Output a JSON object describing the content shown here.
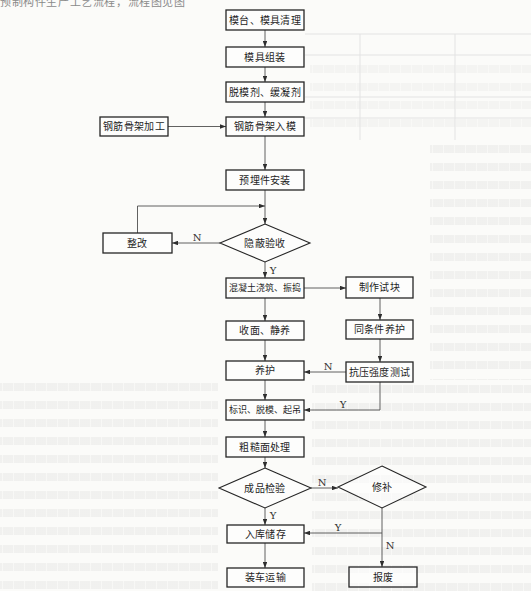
{
  "document": {
    "header_fragment": "预制构件生产工艺流程，流程图见图"
  },
  "flowchart": {
    "nodes": [
      {
        "id": "mold-table-cleaning",
        "label": "模台、模具清理",
        "type": "process"
      },
      {
        "id": "mold-assembly",
        "label": "模具组装",
        "type": "process"
      },
      {
        "id": "release-agent-retarder",
        "label": "脱模剂、缓凝剂",
        "type": "process"
      },
      {
        "id": "rebar-cage-fabrication",
        "label": "钢筋骨架加工",
        "type": "process"
      },
      {
        "id": "rebar-cage-placement",
        "label": "钢筋骨架入模",
        "type": "process"
      },
      {
        "id": "embedded-parts-installation",
        "label": "预埋件安装",
        "type": "process"
      },
      {
        "id": "concealed-work-inspection",
        "label": "隐蔽验收",
        "type": "decision"
      },
      {
        "id": "rectification",
        "label": "整改",
        "type": "process"
      },
      {
        "id": "concrete-pouring-vibrating",
        "label": "混凝土浇筑、振捣",
        "type": "process"
      },
      {
        "id": "test-block-making",
        "label": "制作试块",
        "type": "process"
      },
      {
        "id": "surface-finishing-resting",
        "label": "收面、静养",
        "type": "process"
      },
      {
        "id": "same-condition-curing",
        "label": "同条件养护",
        "type": "process"
      },
      {
        "id": "curing",
        "label": "养护",
        "type": "process"
      },
      {
        "id": "compressive-strength-test",
        "label": "抗压强度测试",
        "type": "process"
      },
      {
        "id": "marking-demolding-lifting",
        "label": "标识、脱模、起吊",
        "type": "process"
      },
      {
        "id": "rough-surface-treatment",
        "label": "粗糙面处理",
        "type": "process"
      },
      {
        "id": "finished-product-inspection",
        "label": "成品检验",
        "type": "decision"
      },
      {
        "id": "repair",
        "label": "修补",
        "type": "decision"
      },
      {
        "id": "warehouse-storage",
        "label": "入库储存",
        "type": "process"
      },
      {
        "id": "loading-transport",
        "label": "装车运输",
        "type": "process"
      },
      {
        "id": "scrap",
        "label": "报废",
        "type": "process"
      }
    ],
    "edges": [
      {
        "from": "mold-table-cleaning",
        "to": "mold-assembly",
        "label": ""
      },
      {
        "from": "mold-assembly",
        "to": "release-agent-retarder",
        "label": ""
      },
      {
        "from": "release-agent-retarder",
        "to": "rebar-cage-placement",
        "label": ""
      },
      {
        "from": "rebar-cage-fabrication",
        "to": "rebar-cage-placement",
        "label": ""
      },
      {
        "from": "rebar-cage-placement",
        "to": "embedded-parts-installation",
        "label": ""
      },
      {
        "from": "embedded-parts-installation",
        "to": "concealed-work-inspection",
        "label": ""
      },
      {
        "from": "concealed-work-inspection",
        "to": "rectification",
        "label": "N"
      },
      {
        "from": "rectification",
        "to": "concealed-work-inspection",
        "label": ""
      },
      {
        "from": "concealed-work-inspection",
        "to": "concrete-pouring-vibrating",
        "label": "Y"
      },
      {
        "from": "concrete-pouring-vibrating",
        "to": "test-block-making",
        "label": ""
      },
      {
        "from": "concrete-pouring-vibrating",
        "to": "surface-finishing-resting",
        "label": ""
      },
      {
        "from": "test-block-making",
        "to": "same-condition-curing",
        "label": ""
      },
      {
        "from": "surface-finishing-resting",
        "to": "curing",
        "label": ""
      },
      {
        "from": "same-condition-curing",
        "to": "compressive-strength-test",
        "label": ""
      },
      {
        "from": "compressive-strength-test",
        "to": "curing",
        "label": "N"
      },
      {
        "from": "curing",
        "to": "marking-demolding-lifting",
        "label": ""
      },
      {
        "from": "compressive-strength-test",
        "to": "marking-demolding-lifting",
        "label": "Y"
      },
      {
        "from": "marking-demolding-lifting",
        "to": "rough-surface-treatment",
        "label": ""
      },
      {
        "from": "rough-surface-treatment",
        "to": "finished-product-inspection",
        "label": ""
      },
      {
        "from": "finished-product-inspection",
        "to": "repair",
        "label": "N"
      },
      {
        "from": "finished-product-inspection",
        "to": "warehouse-storage",
        "label": "Y"
      },
      {
        "from": "repair",
        "to": "warehouse-storage",
        "label": "Y"
      },
      {
        "from": "repair",
        "to": "scrap",
        "label": "N"
      },
      {
        "from": "warehouse-storage",
        "to": "loading-transport",
        "label": ""
      }
    ]
  }
}
